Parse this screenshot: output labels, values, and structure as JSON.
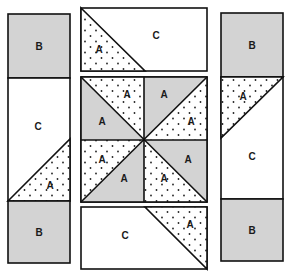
{
  "colors": {
    "gray": "#d3d3d3",
    "white": "#ffffff",
    "stroke": "#111111",
    "dot": "#222222"
  },
  "labels": {
    "a": "A",
    "b": "B",
    "c": "C"
  },
  "pieces": {
    "left_column": {
      "top": "B",
      "middle": "C",
      "middle_triangle": "A",
      "bottom": "B"
    },
    "top_strip": {
      "main": "C",
      "triangle": "A"
    },
    "center_block": {
      "quadrants": [
        {
          "position": "top-left",
          "gray": "A",
          "dotted": "A"
        },
        {
          "position": "top-right",
          "gray": "A",
          "dotted": "A"
        },
        {
          "position": "bottom-left",
          "gray": "A",
          "dotted": "A"
        },
        {
          "position": "bottom-right",
          "gray": "A",
          "dotted": "A"
        }
      ]
    },
    "bottom_strip": {
      "main": "C",
      "triangle": "A"
    },
    "right_column": {
      "top": "B",
      "middle_triangle": "A",
      "middle": "C",
      "bottom": "B"
    }
  }
}
